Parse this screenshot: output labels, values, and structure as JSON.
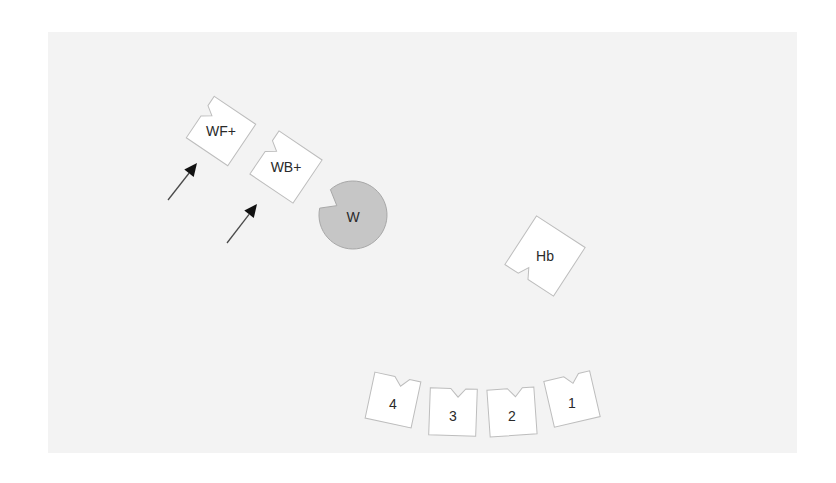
{
  "diagram": {
    "background_color": "#f3f3f3",
    "tile_fill": "#ffffff",
    "disc_fill": "#c6c6c6",
    "tiles": [
      {
        "id": "wf-plus",
        "label": "WF+",
        "cx": 221,
        "cy": 131,
        "size": 50,
        "rotation": 34,
        "notch": "top-left-edge"
      },
      {
        "id": "wb-plus",
        "label": "WB+",
        "cx": 286,
        "cy": 167,
        "size": 52,
        "rotation": 34,
        "notch": "top-left-edge"
      },
      {
        "id": "hb",
        "label": "Hb",
        "cx": 545,
        "cy": 256,
        "size": 58,
        "rotation": 33,
        "notch": "bottom-left-edge"
      },
      {
        "id": "tile-4",
        "label": "4",
        "cx": 393,
        "cy": 400,
        "size": 47,
        "rotation": 12,
        "notch": "top"
      },
      {
        "id": "tile-3",
        "label": "3",
        "cx": 453,
        "cy": 412,
        "size": 47,
        "rotation": 2,
        "notch": "top"
      },
      {
        "id": "tile-2",
        "label": "2",
        "cx": 512,
        "cy": 412,
        "size": 47,
        "rotation": -4,
        "notch": "top"
      },
      {
        "id": "tile-1",
        "label": "1",
        "cx": 572,
        "cy": 399,
        "size": 47,
        "rotation": -13,
        "notch": "top"
      }
    ],
    "disc": {
      "id": "w",
      "label": "W",
      "cx": 353,
      "cy": 215,
      "r": 34,
      "notch_angle": 210
    },
    "arrows": [
      {
        "id": "arrow-to-wf-plus",
        "x1": 168,
        "y1": 200,
        "x2": 197,
        "y2": 163
      },
      {
        "id": "arrow-to-wb-plus",
        "x1": 227,
        "y1": 243,
        "x2": 257,
        "y2": 204
      }
    ]
  }
}
